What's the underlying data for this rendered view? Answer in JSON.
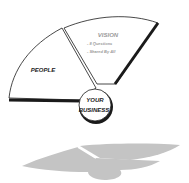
{
  "diagram": {
    "type": "fan-diagram",
    "segments": [
      {
        "id": "people",
        "label": "PEOPLE"
      },
      {
        "id": "vision",
        "label": "VISION",
        "bullets": [
          "- 8 Questions",
          "- Shared By All"
        ]
      }
    ],
    "hub": {
      "line1": "YOUR",
      "line2": "BUSINESS"
    },
    "colors": {
      "stroke": "#1a1a1a",
      "fill": "#ffffff",
      "shadow": "#c4c4c4",
      "vision_text": "#9a9a9a",
      "text": "#1a1a1a"
    }
  }
}
